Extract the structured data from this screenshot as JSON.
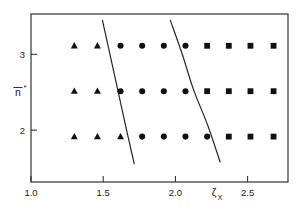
{
  "chart_data": {
    "type": "scatter",
    "title": "",
    "xlabel": "ζ_X",
    "ylabel": "n̄*",
    "xlim": [
      1.0,
      2.78
    ],
    "ylim": [
      1.5,
      3.35
    ],
    "grid": false,
    "legend_position": "none",
    "xticks": [
      1.0,
      1.5,
      2.0,
      2.5
    ],
    "xticklabels": [
      "1.0",
      "1.5",
      "2.0",
      "2.5"
    ],
    "yticks": [
      2,
      3
    ],
    "yticklabels": [
      "2",
      "3"
    ],
    "x_positions": [
      1.3,
      1.46,
      1.62,
      1.77,
      1.92,
      2.07,
      2.22,
      2.37,
      2.52,
      2.68
    ],
    "series": [
      {
        "name": "triangle",
        "marker": "triangle",
        "points": [
          {
            "x": 1.3,
            "y": 3.0
          },
          {
            "x": 1.46,
            "y": 3.0
          },
          {
            "x": 1.3,
            "y": 2.5
          },
          {
            "x": 1.46,
            "y": 2.5
          },
          {
            "x": 1.3,
            "y": 2.0
          },
          {
            "x": 1.46,
            "y": 2.0
          },
          {
            "x": 1.62,
            "y": 2.0
          }
        ]
      },
      {
        "name": "circle",
        "marker": "circle",
        "points": [
          {
            "x": 1.62,
            "y": 3.0
          },
          {
            "x": 1.77,
            "y": 3.0
          },
          {
            "x": 1.92,
            "y": 3.0
          },
          {
            "x": 2.07,
            "y": 3.0
          },
          {
            "x": 1.62,
            "y": 2.5
          },
          {
            "x": 1.77,
            "y": 2.5
          },
          {
            "x": 1.92,
            "y": 2.5
          },
          {
            "x": 2.07,
            "y": 2.5
          },
          {
            "x": 1.77,
            "y": 2.0
          },
          {
            "x": 1.92,
            "y": 2.0
          },
          {
            "x": 2.07,
            "y": 2.0
          },
          {
            "x": 2.22,
            "y": 2.0
          }
        ]
      },
      {
        "name": "square",
        "marker": "square",
        "points": [
          {
            "x": 2.22,
            "y": 3.0
          },
          {
            "x": 2.37,
            "y": 3.0
          },
          {
            "x": 2.52,
            "y": 3.0
          },
          {
            "x": 2.68,
            "y": 3.0
          },
          {
            "x": 2.22,
            "y": 2.5
          },
          {
            "x": 2.37,
            "y": 2.5
          },
          {
            "x": 2.52,
            "y": 2.5
          },
          {
            "x": 2.68,
            "y": 2.5
          },
          {
            "x": 2.37,
            "y": 2.0
          },
          {
            "x": 2.52,
            "y": 2.0
          },
          {
            "x": 2.68,
            "y": 2.0
          }
        ]
      }
    ],
    "boundaries": [
      {
        "name": "left-phase-boundary",
        "points": [
          {
            "x": 1.495,
            "y": 3.28
          },
          {
            "x": 1.545,
            "y": 2.92
          },
          {
            "x": 1.6,
            "y": 2.52
          },
          {
            "x": 1.655,
            "y": 2.12
          },
          {
            "x": 1.715,
            "y": 1.7
          }
        ]
      },
      {
        "name": "right-phase-boundary",
        "points": [
          {
            "x": 1.965,
            "y": 3.28
          },
          {
            "x": 2.045,
            "y": 2.92
          },
          {
            "x": 2.125,
            "y": 2.52
          },
          {
            "x": 2.225,
            "y": 2.12
          },
          {
            "x": 2.31,
            "y": 1.72
          }
        ]
      }
    ]
  },
  "axes": {
    "xlabel_symbol": "ζ",
    "xlabel_subscript": "X",
    "ylabel_letter": "n",
    "ylabel_superscript": "*"
  }
}
